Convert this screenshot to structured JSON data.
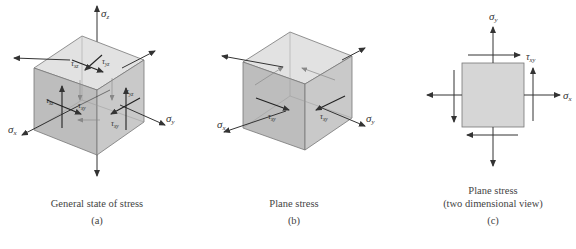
{
  "figure": {
    "panels": [
      {
        "id": "a",
        "caption": "General state of stress",
        "label": "(a)",
        "symbols": {
          "sigma_z": "σ",
          "sigma_z_sub": "z",
          "sigma_x": "σ",
          "sigma_x_sub": "x",
          "sigma_y": "σ",
          "sigma_y_sub": "y",
          "tau_xz": "τ",
          "tau_xz_sub": "xz",
          "tau_yz": "τ",
          "tau_yz_sub": "yz",
          "tau_xy": "τ",
          "tau_xy_sub": "xy",
          "tau_xz2": "τ",
          "tau_xz2_sub": "xz",
          "tau_yz2": "τ",
          "tau_yz2_sub": "yz",
          "tau_xy2": "τ",
          "tau_xy2_sub": "xy"
        }
      },
      {
        "id": "b",
        "caption": "Plane stress",
        "label": "(b)",
        "symbols": {
          "sigma_x": "σ",
          "sigma_x_sub": "x",
          "sigma_y": "σ",
          "sigma_y_sub": "y",
          "tau_xy": "τ",
          "tau_xy_sub": "xy",
          "tau_xy2": "τ",
          "tau_xy2_sub": "xy"
        }
      },
      {
        "id": "c",
        "caption": "Plane stress",
        "caption2": "(two dimensional view)",
        "label": "(c)",
        "symbols": {
          "sigma_y": "σ",
          "sigma_y_sub": "y",
          "sigma_x": "σ",
          "sigma_x_sub": "x",
          "tau_xy": "τ",
          "tau_xy_sub": "xy"
        }
      }
    ],
    "colors": {
      "cube_top": "#e2e2e2",
      "cube_left": "#bdbdbd",
      "cube_right": "#c9c9c9",
      "square_fill": "#d6d6d6",
      "arrow": "#333333"
    }
  }
}
